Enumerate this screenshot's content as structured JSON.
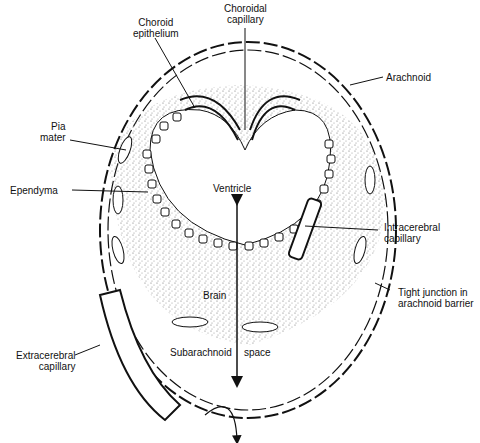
{
  "labels": {
    "choroid_epithelium": "Choroid\nepithelium",
    "choroid_epithelium_l1": "Choroid",
    "choroid_epithelium_l2": "epithelium",
    "choroidal_capillary_l1": "Choroidal",
    "choroidal_capillary_l2": "capillary",
    "arachnoid": "Arachnoid",
    "pia_mater_l1": "Pia",
    "pia_mater_l2": "mater",
    "ependyma": "Ependyma",
    "ventricle": "Ventricle",
    "intracerebral_capillary_l1": "Intracerebral",
    "intracerebral_capillary_l2": "capillary",
    "tight_junction_l1": "Tight junction in",
    "tight_junction_l2": "arachnoid barrier",
    "brain": "Brain",
    "subarachnoid": "Subarachnoid",
    "space": "space",
    "extracerebral_capillary_l1": "Extracerebral",
    "extracerebral_capillary_l2": "capillary"
  },
  "colors": {
    "ink": "#111111",
    "stipple": "#555555",
    "background": "#ffffff"
  }
}
